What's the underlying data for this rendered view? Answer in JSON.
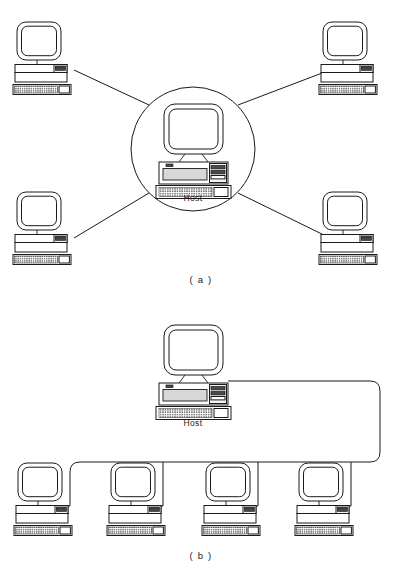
{
  "figure": {
    "background_color": "#ffffff",
    "line_color": "#1a1a1a",
    "width": 403,
    "height": 575
  },
  "panels": [
    {
      "id": "panel-a",
      "caption": "( a )",
      "topology": "star",
      "description": "Star topology: four terminals connected radially to a central host inside a circle",
      "host": {
        "label": "Host",
        "x": 193,
        "y": 147
      },
      "hub": {
        "shape": "circle",
        "cx": 193,
        "cy": 149,
        "r": 62
      },
      "terminals": [
        {
          "id": "terminal-a-top-left",
          "x": 42,
          "y": 52,
          "link_to_hub": true
        },
        {
          "id": "terminal-a-top-right",
          "x": 348,
          "y": 52,
          "link_to_hub": true
        },
        {
          "id": "terminal-a-bottom-left",
          "x": 42,
          "y": 230,
          "link_to_hub": true
        },
        {
          "id": "terminal-a-bottom-right",
          "x": 348,
          "y": 230,
          "link_to_hub": true
        }
      ]
    },
    {
      "id": "panel-b",
      "caption": "( b )",
      "topology": "bus",
      "description": "Bus topology: a host at the top feeds a trunk cable that drops to four terminals in a row",
      "host": {
        "label": "Host",
        "x": 193,
        "y": 370
      },
      "bus": {
        "trunk_y": 462,
        "trunk_left_x": 70,
        "trunk_right_x": 380,
        "corner_radius": 10
      },
      "terminals": [
        {
          "id": "terminal-b-1",
          "x": 52,
          "y": 508,
          "drop_x": 70
        },
        {
          "id": "terminal-b-2",
          "x": 145,
          "y": 508,
          "drop_x": 163
        },
        {
          "id": "terminal-b-3",
          "x": 240,
          "y": 508,
          "drop_x": 258
        },
        {
          "id": "terminal-b-4",
          "x": 333,
          "y": 508,
          "drop_x": 351
        }
      ]
    }
  ],
  "labels": {
    "host": "Host",
    "caption_a": "( a )",
    "caption_b": "( b )"
  },
  "colors": {
    "ink": "#1a1a1a",
    "paper": "#ffffff",
    "screen_fill": "#ffffff",
    "panel_light": "#f4f4f4",
    "drive_grey": "#d8d8d8",
    "slot_dark": "#4a4a4a"
  }
}
